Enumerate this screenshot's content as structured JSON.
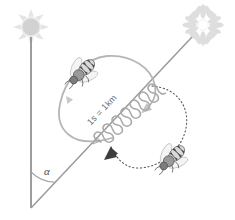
{
  "diagram": {
    "background_color": "#ffffff",
    "labels": {
      "duration_distance": "1s = 1km",
      "angle": "α"
    },
    "colors": {
      "sun": "#e2e2e2",
      "flower": "#e0e0e0",
      "flower_center": "#ffffff",
      "vertical_line": "#8c8c8c",
      "direction_line": "#9a9a9a",
      "solid_loop": "#b4b4b4",
      "dotted_loop": "#5a5a5a",
      "waggle_path": "#a8a8a8",
      "bee_body": "#555555",
      "bee_stripe_light": "#d8d8d8",
      "bee_wing": "#f2f2f2",
      "arrow_dark": "#3d3d3d",
      "text": "#6e6e6e"
    },
    "elements": [
      {
        "name": "sun",
        "role": "celestial reference (vertical up)",
        "cx": 31,
        "cy": 27,
        "radius": 9,
        "rays": 8
      },
      {
        "name": "flower",
        "role": "food source target",
        "cx": 203,
        "cy": 25,
        "radius": 16,
        "petals": 14
      },
      {
        "name": "vertical-line",
        "role": "gravity / sun reference axis",
        "x1": 31,
        "y1": 38,
        "x2": 31,
        "y2": 208
      },
      {
        "name": "direction-line",
        "role": "waggle run direction toward flower",
        "x1": 31,
        "y1": 208,
        "x2": 191,
        "y2": 38
      },
      {
        "name": "angle-arc",
        "role": "angle alpha between sun axis and food direction",
        "value_text": "α"
      },
      {
        "name": "left-loop",
        "role": "return loop, counterclockwise (solid)",
        "style": "solid"
      },
      {
        "name": "right-loop",
        "role": "return loop, clockwise (dotted)",
        "style": "dotted"
      },
      {
        "name": "waggle-path",
        "role": "waggle run zigzag along direction line"
      },
      {
        "name": "bee-upper",
        "role": "dancing bee on upper-left loop"
      },
      {
        "name": "bee-lower",
        "role": "dancing bee on lower-right loop"
      }
    ]
  }
}
